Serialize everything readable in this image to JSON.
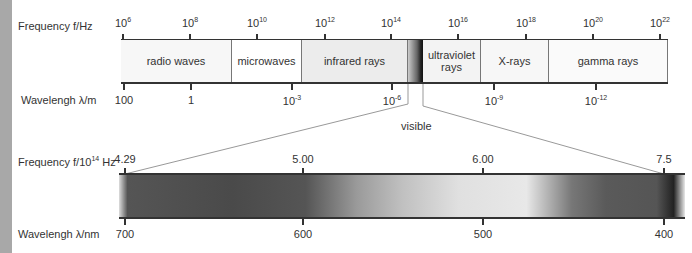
{
  "top_scale": {
    "frequency_label": "Frequency f/Hz",
    "wavelength_label": "Wavelengh λ/m",
    "frequency_ticks": [
      {
        "base": "10",
        "exp": "6"
      },
      {
        "base": "10",
        "exp": "8"
      },
      {
        "base": "10",
        "exp": "10"
      },
      {
        "base": "10",
        "exp": "12"
      },
      {
        "base": "10",
        "exp": "14"
      },
      {
        "base": "10",
        "exp": "16"
      },
      {
        "base": "10",
        "exp": "18"
      },
      {
        "base": "10",
        "exp": "20"
      },
      {
        "base": "10",
        "exp": "22"
      }
    ],
    "wavelength_ticks": [
      {
        "base": "100",
        "exp": ""
      },
      {
        "base": "1",
        "exp": ""
      },
      {
        "base": "10",
        "exp": "-3"
      },
      {
        "base": "10",
        "exp": "-6"
      },
      {
        "base": "10",
        "exp": "-9"
      },
      {
        "base": "10",
        "exp": "-12"
      }
    ],
    "bands": [
      {
        "name": "radio waves",
        "color": "#f7f7f7"
      },
      {
        "name": "microwaves",
        "color": "#ffffff"
      },
      {
        "name": "infrared rays",
        "color": "#ececec"
      },
      {
        "name": "ultraviolet rays",
        "color": "#f3f3f3"
      },
      {
        "name": "X-rays",
        "color": "#f7f7f7"
      },
      {
        "name": "gamma rays",
        "color": "#fafafa"
      }
    ],
    "visible_label": "visible"
  },
  "bottom_scale": {
    "frequency_label": "Frequency f/10",
    "frequency_label_exp": "14",
    "frequency_label_unit": " Hz",
    "wavelength_label": "Wavelengh λ/nm",
    "frequency_ticks": [
      "4.29",
      "5.00",
      "6.00",
      "7.5"
    ],
    "wavelength_ticks": [
      "700",
      "600",
      "500",
      "400"
    ]
  }
}
